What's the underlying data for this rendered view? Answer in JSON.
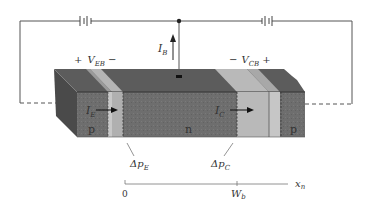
{
  "diagram": {
    "labels": {
      "v_eb": {
        "plus": "+",
        "name": "V",
        "sub": "EB",
        "minus": "−"
      },
      "v_cb": {
        "minus": "−",
        "name": "V",
        "sub": "CB",
        "plus": "+"
      },
      "i_b": {
        "name": "I",
        "sub": "B"
      },
      "i_e": {
        "name": "I",
        "sub": "E"
      },
      "i_c": {
        "name": "I",
        "sub": "C"
      },
      "region_emitter": "p",
      "region_base": "n",
      "region_collector": "p",
      "delta_pe": {
        "name": "Δp",
        "sub": "E"
      },
      "delta_pc": {
        "name": "Δp",
        "sub": "C"
      }
    },
    "axis": {
      "origin_label": "0",
      "wb_label": {
        "name": "W",
        "sub": "b"
      },
      "x_label": {
        "name": "x",
        "sub": "n"
      }
    },
    "colors": {
      "front_dark": "#6e6e6e",
      "top_dark": "#5a5a5a",
      "side_dark": "#4a4a4a",
      "junction_light": "#b9b9b9",
      "junction_lighter": "#cfcfcf",
      "wire": "#555555"
    }
  }
}
